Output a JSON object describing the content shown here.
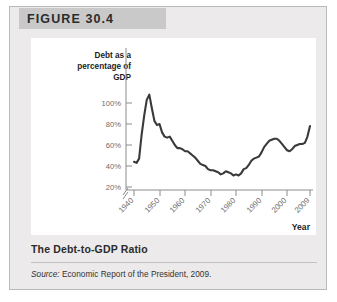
{
  "figure": {
    "header_label": "FIGURE 30.4",
    "caption_title": "The Debt-to-GDP Ratio",
    "source_prefix": "Source:",
    "source_text": " Economic Report of the President, 2009."
  },
  "chart_data": {
    "type": "line",
    "title": "",
    "xlabel": "Year",
    "ylabel": "Debt as a percentage of GDP",
    "ylabel_lines": [
      "Debt as a",
      "percentage of",
      "GDP"
    ],
    "grid": false,
    "legend": "none",
    "xlim": [
      1940,
      2009
    ],
    "ylim": [
      14,
      112
    ],
    "ytick_labels": [
      "100%",
      "80%",
      "60%",
      "40%",
      "20%"
    ],
    "ytick_values": [
      100,
      80,
      60,
      40,
      20
    ],
    "xtick_labels": [
      "1940",
      "1950",
      "1960",
      "1970",
      "1980",
      "1990",
      "2000",
      "2009"
    ],
    "xtick_values": [
      1940,
      1950,
      1960,
      1970,
      1980,
      1990,
      2000,
      2009
    ],
    "axis_break": true,
    "line_color": "#3a3a3a",
    "series": [
      {
        "name": "Debt as a percentage of GDP",
        "x": [
          1940,
          1941,
          1942,
          1943,
          1944,
          1945,
          1946,
          1947,
          1948,
          1949,
          1950,
          1951,
          1952,
          1953,
          1954,
          1955,
          1956,
          1957,
          1958,
          1959,
          1960,
          1961,
          1962,
          1963,
          1964,
          1965,
          1966,
          1967,
          1968,
          1969,
          1970,
          1971,
          1972,
          1973,
          1974,
          1975,
          1976,
          1977,
          1978,
          1979,
          1980,
          1981,
          1982,
          1983,
          1984,
          1985,
          1986,
          1987,
          1988,
          1989,
          1990,
          1991,
          1992,
          1993,
          1994,
          1995,
          1996,
          1997,
          1998,
          1999,
          2000,
          2001,
          2002,
          2003,
          2004,
          2005,
          2006,
          2007,
          2008,
          2009
        ],
        "y": [
          44,
          43,
          47,
          70,
          88,
          103,
          108,
          95,
          83,
          79,
          80,
          72,
          68,
          67,
          68,
          64,
          60,
          57,
          57,
          56,
          54,
          54,
          52,
          50,
          48,
          45,
          42,
          41,
          40,
          37,
          36,
          36,
          35,
          34,
          32,
          33,
          35,
          34,
          33,
          31,
          32,
          31,
          33,
          37,
          38,
          41,
          45,
          47,
          48,
          49,
          53,
          58,
          61,
          64,
          65,
          66,
          66,
          64,
          61,
          58,
          55,
          54,
          56,
          59,
          60,
          61,
          61,
          62,
          68,
          78
        ]
      }
    ]
  }
}
